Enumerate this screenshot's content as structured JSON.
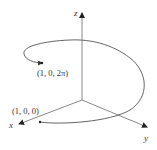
{
  "diagram": {
    "type": "3d-axes-helix",
    "axes": {
      "x_label": "x",
      "y_label": "y",
      "z_label": "z"
    },
    "points": [
      {
        "label": "(1, 0, 0)",
        "description": "helix start point on x-axis"
      },
      {
        "label": "(1, 0, 2π)",
        "description": "helix end point after one full turn"
      }
    ],
    "colors": {
      "axis": "#777777",
      "curve": "#555555",
      "text": "#333333"
    }
  }
}
